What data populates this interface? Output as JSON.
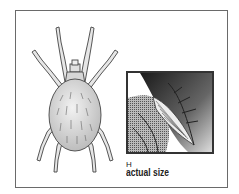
{
  "figure": {
    "inset": "leaf close-up showing actual size",
    "label_letter": "H",
    "label_caption": "actual size"
  },
  "colors": {
    "frame_border": "#6a6a6a",
    "inset_border": "#333333",
    "body_fill": "#d8d8d8",
    "outline": "#444444"
  }
}
